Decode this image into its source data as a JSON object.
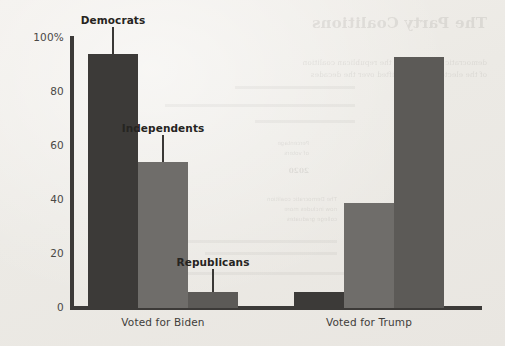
{
  "chart_data": {
    "type": "bar",
    "title": "",
    "subtitle": "",
    "xlabel": "",
    "ylabel": "",
    "ylim": [
      0,
      100
    ],
    "ytick_labels": [
      "100%",
      "80",
      "60",
      "40",
      "20",
      "0"
    ],
    "ytick_values": [
      100,
      80,
      60,
      40,
      20,
      0
    ],
    "grid": false,
    "legend_position": "inline-callout-labels",
    "categories": [
      "Voted for Biden",
      "Voted for Trump"
    ],
    "series": [
      {
        "name": "Democrats",
        "values": [
          94,
          6
        ],
        "color": "#3c3a38"
      },
      {
        "name": "Independents",
        "values": [
          54,
          39
        ],
        "color": "#6f6d6a"
      },
      {
        "name": "Republicans",
        "values": [
          6,
          93
        ],
        "color": "#5c5a57"
      }
    ],
    "annotations": [
      {
        "label": "Democrats",
        "points_to": {
          "category": "Voted for Biden",
          "series": "Democrats"
        }
      },
      {
        "label": "Independents",
        "points_to": {
          "category": "Voted for Biden",
          "series": "Independents"
        }
      },
      {
        "label": "Republicans",
        "points_to": {
          "category": "Voted for Biden",
          "series": "Republicans"
        }
      }
    ]
  },
  "axis": {
    "y_tick_100": "100%",
    "y_tick_80": "80",
    "y_tick_60": "60",
    "y_tick_40": "40",
    "y_tick_20": "20",
    "y_tick_0": "0"
  },
  "groups": {
    "biden_label": "Voted for Biden",
    "trump_label": "Voted for Trump"
  },
  "callouts": {
    "democrats": "Democrats",
    "independents": "Independents",
    "republicans": "Republicans"
  },
  "bleed_through": {
    "heading": "The Party Coalitions",
    "line_1": "democratic coalition and the republican coalition",
    "line_2": "of the electorate have shifted over the decades",
    "line_3": "Percentage",
    "line_4": "of voters",
    "line_5": "2020",
    "line_6": "The Democratic coalition",
    "line_7": "now includes more",
    "line_8": "college graduates"
  },
  "colors": {
    "background": "#eeebe6",
    "axis": "#3c3a38",
    "democrats": "#3c3a38",
    "independents": "#6f6d6a",
    "republicans": "#5c5a57",
    "tick_text": "#4a4845",
    "label_text": "#3f3d3a",
    "callout_text": "#262421"
  }
}
